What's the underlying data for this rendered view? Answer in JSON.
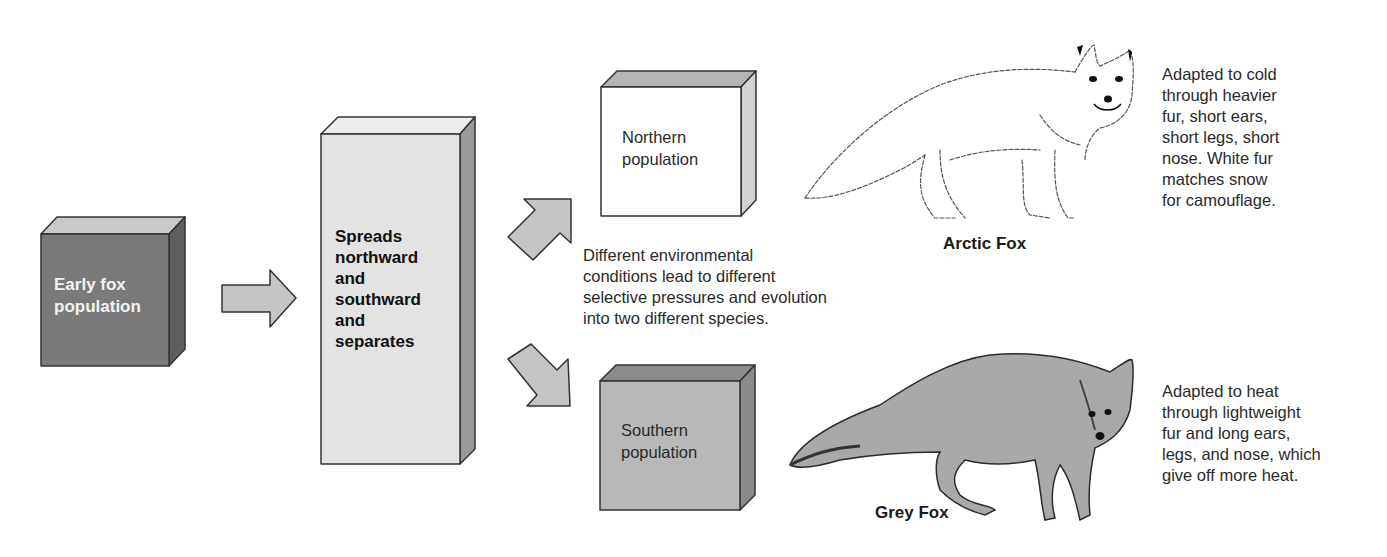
{
  "colors": {
    "early_box_front": "#7a7a7a",
    "early_box_top": "#c9c9c9",
    "early_box_side": "#5e5e5e",
    "spread_box_front": "#e3e3e3",
    "spread_box_top": "#ededed",
    "spread_box_side": "#9a9a9a",
    "north_box_front": "#ffffff",
    "north_box_top": "#b5b5b5",
    "north_box_side": "#d2d2d2",
    "south_box_front": "#b8b8b8",
    "south_box_top": "#8c8c8c",
    "south_box_side": "#8a8a8a",
    "arrow_fill": "#c4c4c4",
    "outline": "#333333"
  },
  "boxes": {
    "early": {
      "lines": [
        "Early fox",
        "population"
      ]
    },
    "spread": {
      "lines": [
        "Spreads",
        "northward",
        "and",
        "southward",
        "and",
        "separates"
      ]
    },
    "north": {
      "lines": [
        "Northern",
        "population"
      ]
    },
    "south": {
      "lines": [
        "Southern",
        "population"
      ]
    }
  },
  "middle_caption": {
    "lines": [
      "Different environmental",
      "conditions lead to different",
      "selective pressures and evolution",
      "into two different species."
    ]
  },
  "arctic": {
    "name": "Arctic Fox",
    "description": [
      "Adapted to cold",
      "through heavier",
      "fur, short ears,",
      "short legs, short",
      "nose. White fur",
      "matches snow",
      "for camouflage."
    ]
  },
  "grey": {
    "name": "Grey Fox",
    "description": [
      "Adapted to heat",
      "through lightweight",
      "fur and long ears,",
      "legs, and nose, which",
      "give off more heat."
    ]
  },
  "icons": {
    "arrow_right": "arrow-right-icon",
    "arrow_up_right": "arrow-up-right-icon",
    "arrow_down_right": "arrow-down-right-icon",
    "arctic_fox": "arctic-fox-illustration",
    "grey_fox": "grey-fox-illustration"
  }
}
